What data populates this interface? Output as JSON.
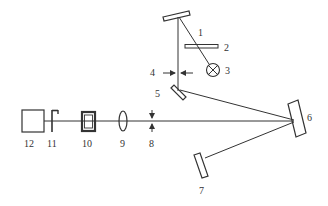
{
  "diagram": {
    "type": "optical-setup-schematic",
    "colors": {
      "line": "#333333",
      "background": "#ffffff"
    },
    "labels": {
      "l1": "1",
      "l2": "2",
      "l3": "3",
      "l4": "4",
      "l5": "5",
      "l6": "6",
      "l7": "7",
      "l8": "8",
      "l9": "9",
      "l10": "10",
      "l11": "11",
      "l12": "12"
    },
    "components": [
      {
        "id": "1",
        "shape": "tilted-mirror",
        "position": "top"
      },
      {
        "id": "2",
        "shape": "horizontal-plate"
      },
      {
        "id": "3",
        "shape": "lamp-circle-x"
      },
      {
        "id": "4",
        "shape": "slit-arrows"
      },
      {
        "id": "5",
        "shape": "tilted-mirror"
      },
      {
        "id": "6",
        "shape": "concave-mirror"
      },
      {
        "id": "7",
        "shape": "mirror"
      },
      {
        "id": "8",
        "shape": "slit-arrows-vertical"
      },
      {
        "id": "9",
        "shape": "lens"
      },
      {
        "id": "10",
        "shape": "cell"
      },
      {
        "id": "11",
        "shape": "shutter"
      },
      {
        "id": "12",
        "shape": "detector-box"
      }
    ]
  }
}
